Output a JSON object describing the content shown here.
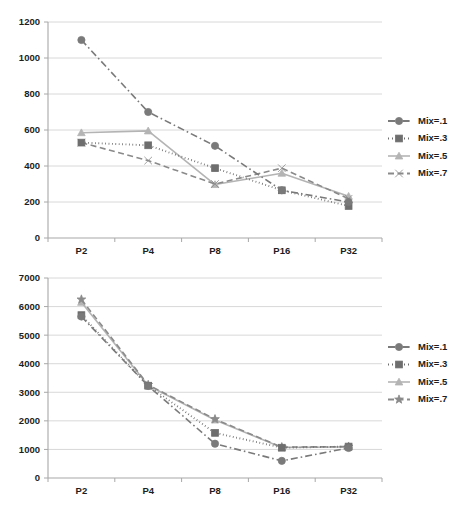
{
  "chart_data": [
    {
      "id": "top",
      "type": "line",
      "title": "",
      "xlabel": "",
      "ylabel": "",
      "categories": [
        "P2",
        "P4",
        "P8",
        "P16",
        "P32"
      ],
      "ylim": [
        0,
        1200
      ],
      "yticks": [
        0,
        200,
        400,
        600,
        800,
        1000,
        1200
      ],
      "ytick_labels": [
        "0",
        "200",
        "400",
        "600",
        "800",
        "1000",
        "1200"
      ],
      "grid": true,
      "legend_position": "right",
      "series": [
        {
          "name": "Mix=.1",
          "values": [
            1100,
            700,
            512,
            265,
            200
          ],
          "color": "#7a7a7a",
          "marker": "circle",
          "dash": "dashdot"
        },
        {
          "name": "Mix=.3",
          "values": [
            530,
            515,
            388,
            265,
            178
          ],
          "color": "#6e6e6e",
          "marker": "square",
          "dash": "dotted"
        },
        {
          "name": "Mix=.5",
          "values": [
            585,
            595,
            297,
            360,
            232
          ],
          "color": "#b4b4b4",
          "marker": "triangle",
          "dash": "solid"
        },
        {
          "name": "Mix=.7",
          "values": [
            530,
            430,
            300,
            388,
            218
          ],
          "color": "#8a8a8a",
          "marker": "cross",
          "dash": "dashed"
        }
      ]
    },
    {
      "id": "bottom",
      "type": "line",
      "title": "",
      "xlabel": "",
      "ylabel": "",
      "categories": [
        "P2",
        "P4",
        "P8",
        "P16",
        "P32"
      ],
      "ylim": [
        0,
        7000
      ],
      "yticks": [
        0,
        1000,
        2000,
        3000,
        4000,
        5000,
        6000,
        7000
      ],
      "ytick_labels": [
        "0",
        "1000",
        "2000",
        "3000",
        "4000",
        "5000",
        "6000",
        "7000"
      ],
      "grid": true,
      "legend_position": "right",
      "series": [
        {
          "name": "Mix=.1",
          "values": [
            5650,
            3220,
            1200,
            600,
            1050
          ],
          "color": "#7a7a7a",
          "marker": "circle",
          "dash": "dashdot"
        },
        {
          "name": "Mix=.3",
          "values": [
            5700,
            3230,
            1580,
            1060,
            1100
          ],
          "color": "#6e6e6e",
          "marker": "square",
          "dash": "dotted"
        },
        {
          "name": "Mix=.5",
          "values": [
            6150,
            3240,
            2030,
            1070,
            1090
          ],
          "color": "#b4b4b4",
          "marker": "triangle",
          "dash": "solid"
        },
        {
          "name": "Mix=.7",
          "values": [
            6250,
            3260,
            2060,
            1080,
            1100
          ],
          "color": "#8a8a8a",
          "marker": "star",
          "dash": "dashed"
        }
      ]
    }
  ],
  "legends": {
    "top": [
      "Mix=.1",
      "Mix=.3",
      "Mix=.5",
      "Mix=.7"
    ],
    "bottom": [
      "Mix=.1",
      "Mix=.3",
      "Mix=.5",
      "Mix=.7"
    ]
  }
}
